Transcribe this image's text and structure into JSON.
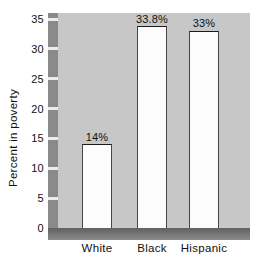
{
  "chart_data": {
    "type": "bar",
    "title": "",
    "ylabel": "Percent in poverty",
    "xlabel": "",
    "categories": [
      "White",
      "Black",
      "Hispanic"
    ],
    "values": [
      14,
      33.8,
      33
    ],
    "bar_labels": [
      "14%",
      "33.8%",
      "33%"
    ],
    "ylim": [
      0,
      35
    ],
    "yticks": [
      0,
      5,
      10,
      15,
      20,
      25,
      30,
      35
    ],
    "grid": "off",
    "legend": "none",
    "colors": {
      "page_background": "#ffffff",
      "plot_background": "#c7c7c7",
      "axis_bar": "#8a8a8a",
      "axis_bar_dark": "#616161",
      "tick_notch": "#ededed",
      "bar_fill": "#fcfcfc",
      "bar_border": "#474747",
      "text": "#111111"
    }
  }
}
